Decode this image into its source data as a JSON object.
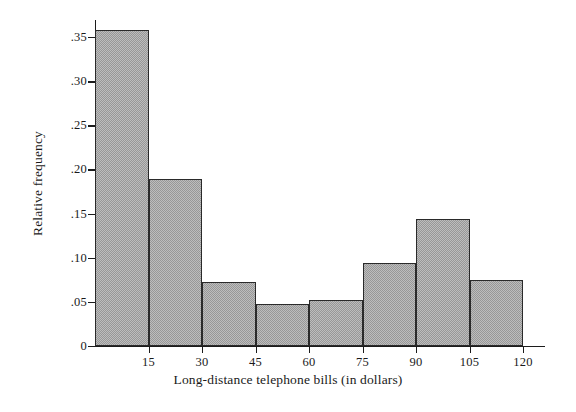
{
  "chart_data": {
    "type": "bar",
    "title": "",
    "subtitle": "",
    "xlabel": "Long-distance telephone bills (in dollars)",
    "ylabel": "Relative frequency",
    "xlim": [
      0,
      120
    ],
    "ylim": [
      0,
      0.37
    ],
    "grid": false,
    "legend": null,
    "bin_width": 15,
    "x_tick_labels": [
      "15",
      "30",
      "45",
      "60",
      "75",
      "90",
      "105",
      "120"
    ],
    "x_tick_values": [
      15,
      30,
      45,
      60,
      75,
      90,
      105,
      120
    ],
    "y_tick_labels": [
      ".35",
      ".30",
      ".25",
      ".20",
      ".15",
      ".10",
      ".05",
      "0"
    ],
    "y_tick_values": [
      0.35,
      0.3,
      0.25,
      0.2,
      0.15,
      0.1,
      0.05,
      0
    ],
    "categories": [
      "0-15",
      "15-30",
      "30-45",
      "45-60",
      "60-75",
      "75-90",
      "90-105",
      "105-120"
    ],
    "bin_edges": [
      0,
      15,
      30,
      45,
      60,
      75,
      90,
      105,
      120
    ],
    "values": [
      0.358,
      0.189,
      0.072,
      0.048,
      0.052,
      0.094,
      0.144,
      0.075
    ],
    "bar_fill_color": "#a9a9a9",
    "bar_edge_color": "#2a2a2a",
    "axis_color": "#1c1c1c",
    "background_color": "#ffffff"
  }
}
